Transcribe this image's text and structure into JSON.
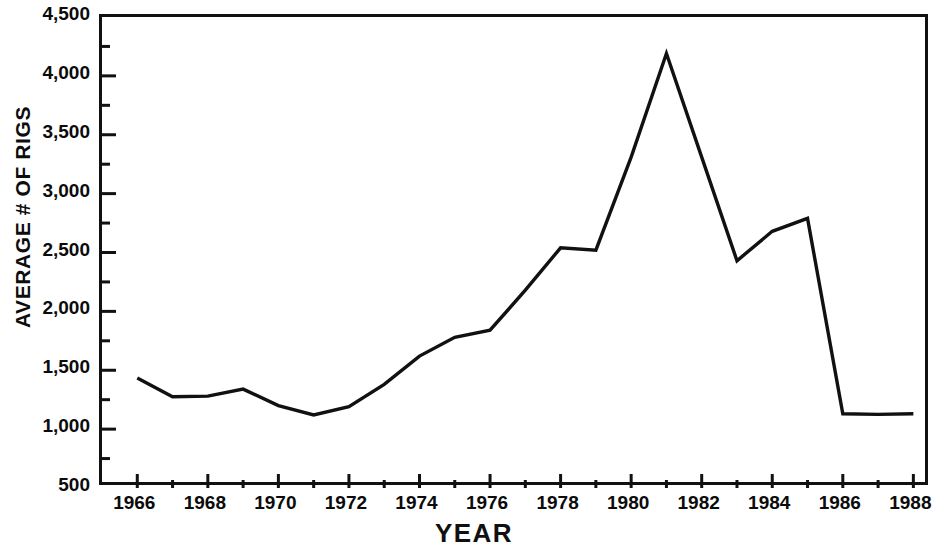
{
  "chart_data": {
    "type": "line",
    "title": "",
    "xlabel": "YEAR",
    "ylabel": "AVERAGE # OF RIGS",
    "xlim": [
      1965,
      1988.5
    ],
    "ylim": [
      500,
      4500
    ],
    "grid": false,
    "legend": null,
    "x_tick_labels": [
      "1966",
      "1968",
      "1970",
      "1972",
      "1974",
      "1976",
      "1978",
      "1980",
      "1982",
      "1984",
      "1986",
      "1988"
    ],
    "x_tick_values": [
      1966,
      1968,
      1970,
      1972,
      1974,
      1976,
      1978,
      1980,
      1982,
      1984,
      1986,
      1988
    ],
    "x_minor_tick_values": [
      1965,
      1967,
      1969,
      1971,
      1973,
      1975,
      1977,
      1979,
      1981,
      1983,
      1985,
      1987
    ],
    "y_tick_labels": [
      "4,500",
      "4,000",
      "3,500",
      "3,000",
      "2,500",
      "2,000",
      "1,500",
      "1,000",
      "500"
    ],
    "y_tick_values": [
      4500,
      4000,
      3500,
      3000,
      2500,
      2000,
      1500,
      1000,
      500
    ],
    "y_minor_tick_values": [
      4250,
      3750,
      3250,
      2750,
      2250,
      1750,
      1250,
      750
    ],
    "series": [
      {
        "name": "Average # of Rigs",
        "color": "#111111",
        "x": [
          1966,
          1967,
          1968,
          1969,
          1970,
          1971,
          1972,
          1973,
          1974,
          1975,
          1976,
          1977,
          1978,
          1979,
          1980,
          1981,
          1982,
          1983,
          1984,
          1985,
          1986,
          1987,
          1988
        ],
        "values": [
          1435,
          1275,
          1280,
          1340,
          1200,
          1120,
          1190,
          1380,
          1620,
          1780,
          1840,
          2180,
          2540,
          2520,
          3310,
          4190,
          3310,
          2430,
          2680,
          2790,
          1130,
          1125,
          1130
        ]
      }
    ]
  }
}
